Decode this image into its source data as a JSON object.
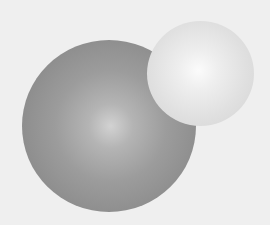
{
  "scene": {
    "description": "Two shaded gray spheres on a light background",
    "background_color": "#efefef",
    "spheres": [
      {
        "name": "large-dark-sphere",
        "center": [
          109,
          126
        ],
        "radius": 86,
        "edge_color": "#858585",
        "highlight_color": "#d2d2d2"
      },
      {
        "name": "small-light-sphere",
        "center": [
          200,
          73
        ],
        "radius": 53,
        "edge_color": "#d0d0d0",
        "highlight_color": "#fbfbfb"
      }
    ]
  }
}
